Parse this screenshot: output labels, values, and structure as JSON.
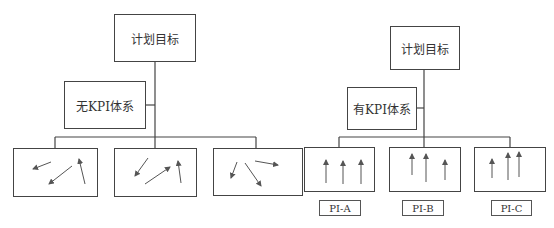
{
  "left": {
    "top_box": "计划目标",
    "system_box": "无KPI体系",
    "children": [
      "scattered-arrows-1",
      "scattered-arrows-2",
      "scattered-arrows-3"
    ]
  },
  "right": {
    "top_box": "计划目标",
    "system_box": "有KPI体系",
    "children": [
      {
        "label": "PI-A"
      },
      {
        "label": "PI-B"
      },
      {
        "label": "PI-C"
      }
    ]
  },
  "colors": {
    "line": "#444444",
    "background": "#ffffff"
  }
}
